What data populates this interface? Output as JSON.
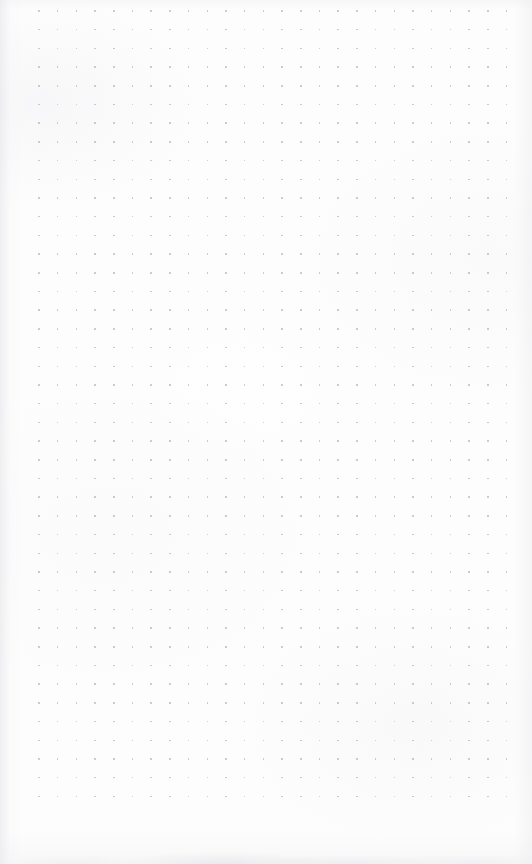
{
  "page": {
    "kind": "blank-dot-grid-paper",
    "content_text": "",
    "width_px": 532,
    "height_px": 864,
    "background_color": "#fdfdfd"
  },
  "grid": {
    "pattern": "dot-grid",
    "dot_color": "#b9b9bf",
    "dot_diameter_px": 1.6,
    "spacing_x_px": 18.7,
    "spacing_y_px": 18.7,
    "origin_x_px": 39,
    "origin_y_px": 11,
    "columns": 26,
    "rows": 43,
    "margin_left_px": 39,
    "margin_right_px": 24,
    "margin_top_px": 11,
    "margin_bottom_px": 59
  },
  "paper": {
    "texture": "scanned-paper",
    "left_edge_shadow_color": "#e4e4e8",
    "bottom_smudge_color": "#e0e0e4",
    "vignette": true
  }
}
